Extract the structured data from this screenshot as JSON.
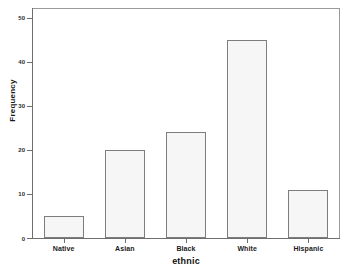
{
  "chart_data": {
    "type": "bar",
    "title": "",
    "subtitle": "",
    "xlabel": "ethnic",
    "ylabel": "Frequency",
    "categories": [
      "Native",
      "Asian",
      "Black",
      "White",
      "Hispanic"
    ],
    "values": [
      5,
      20,
      24,
      45,
      11
    ],
    "ylim": [
      0,
      52
    ],
    "yticks": [
      0,
      10,
      20,
      30,
      40,
      50
    ],
    "ytick_labels": [
      "0",
      "10",
      "20",
      "30",
      "40",
      "50"
    ],
    "grid": false,
    "legend": null,
    "legend_position": "none",
    "annotations": [],
    "style": {
      "bar_fill": "#f6f6f6",
      "bar_border": "#7d7d7d",
      "axis_color": "#6e6e6e",
      "frame_color": "#9a9a9a",
      "background": "#ffffff",
      "text_color": "#1a1a1a"
    }
  }
}
